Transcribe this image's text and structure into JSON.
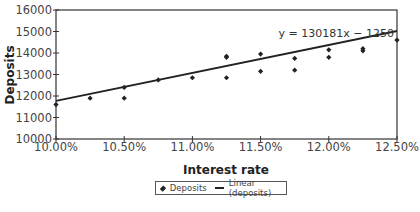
{
  "chart_data": {
    "type": "scatter",
    "title": "",
    "xlabel": "Interest rate",
    "ylabel": "Deposits",
    "xlim": [
      0.1,
      0.125
    ],
    "ylim": [
      10000,
      16000
    ],
    "x_ticks": [
      "10.00%",
      "10.50%",
      "11.00%",
      "11.50%",
      "12.00%",
      "12.50%"
    ],
    "y_ticks": [
      "10000",
      "11000",
      "12000",
      "13000",
      "14000",
      "15000",
      "16000"
    ],
    "grid": false,
    "legend_position": "bottom",
    "legend": [
      "Deposits",
      "Linear (deposits)"
    ],
    "series": [
      {
        "name": "Deposits",
        "kind": "scatter",
        "marker": "diamond",
        "points": [
          [
            0.1,
            11600
          ],
          [
            0.1025,
            11900
          ],
          [
            0.105,
            12400
          ],
          [
            0.105,
            11900
          ],
          [
            0.1075,
            12750
          ],
          [
            0.11,
            12850
          ],
          [
            0.1125,
            13850
          ],
          [
            0.1125,
            13800
          ],
          [
            0.1125,
            12850
          ],
          [
            0.115,
            13950
          ],
          [
            0.115,
            13150
          ],
          [
            0.1175,
            13750
          ],
          [
            0.1175,
            13200
          ],
          [
            0.12,
            14150
          ],
          [
            0.12,
            13800
          ],
          [
            0.1225,
            14200
          ],
          [
            0.1225,
            14100
          ],
          [
            0.125,
            14600
          ]
        ]
      },
      {
        "name": "Linear (deposits)",
        "kind": "line",
        "equation": "y = 130181x − 1250",
        "points": [
          [
            0.1,
            11768
          ],
          [
            0.125,
            15023
          ]
        ]
      }
    ],
    "annotations": [
      {
        "text": "y = 130181x − 1250",
        "position": "upper-right"
      }
    ]
  },
  "legend": {
    "deposits_label": "Deposits",
    "linear_label": "Linear (deposits)"
  }
}
